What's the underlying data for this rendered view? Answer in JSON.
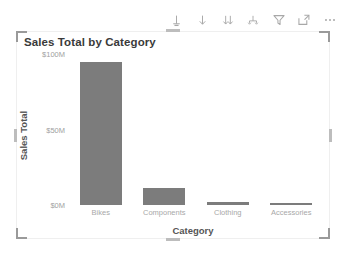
{
  "toolbar": {
    "buttons": [
      {
        "name": "drill-up-icon",
        "label": "Drill up"
      },
      {
        "name": "drill-down-icon",
        "label": "Drill down"
      },
      {
        "name": "expand-next-level-icon",
        "label": "Go to the next level in the hierarchy"
      },
      {
        "name": "expand-all-down-icon",
        "label": "Expand all down one level in the hierarchy"
      },
      {
        "name": "filter-icon",
        "label": "Filters"
      },
      {
        "name": "focus-mode-icon",
        "label": "Focus mode"
      },
      {
        "name": "more-options-icon",
        "label": "More options"
      }
    ]
  },
  "visual": {
    "title": "Sales Total by Category"
  },
  "chart_data": {
    "type": "bar",
    "title": "Sales Total by Category",
    "xlabel": "Category",
    "ylabel": "Sales Total",
    "categories": [
      "Bikes",
      "Components",
      "Clothing",
      "Accessories"
    ],
    "values": [
      95,
      11,
      2,
      1.5
    ],
    "value_unit": "M",
    "ylim": [
      0,
      100
    ],
    "yticks": [
      0,
      50,
      100
    ],
    "ytick_labels": [
      "$0M",
      "$50M",
      "$100M"
    ],
    "grid": false,
    "legend": "none",
    "bar_color": "#7c7c7c"
  },
  "colors": {
    "bar": "#7c7c7c",
    "card_border": "#efefef",
    "handle": "#9a9a9a",
    "axis_text": "#a8a8a8",
    "title_text": "#3a3a3a"
  }
}
